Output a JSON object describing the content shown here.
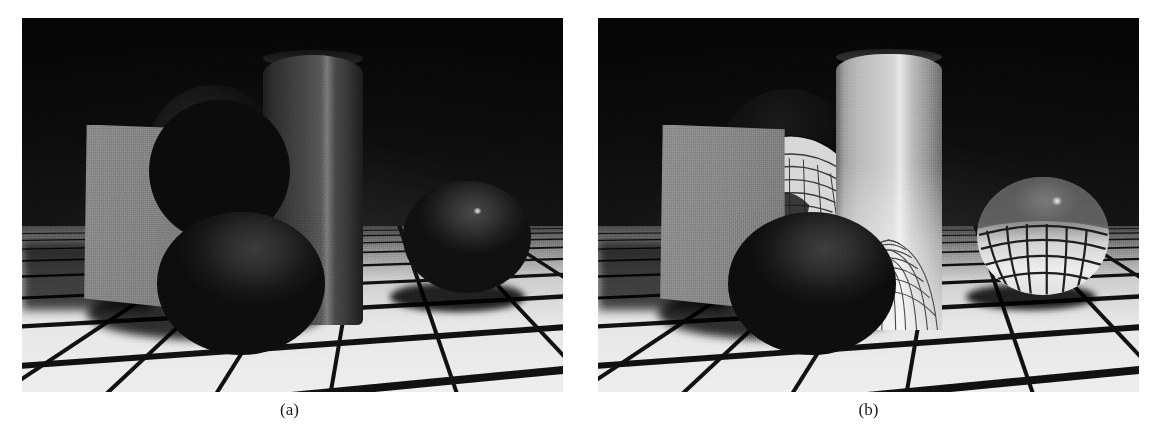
{
  "figure": {
    "kind": "two-panel raytraced scene comparison",
    "panels": [
      {
        "id": "a",
        "caption": "(a)",
        "description": "Scene rendered with opaque diffuse materials",
        "objects": [
          {
            "name": "back-wall",
            "material": "dark matte",
            "color": "#0a0a0a"
          },
          {
            "name": "checkered-floor",
            "material": "tiled, light",
            "color": "#e8e8e8",
            "grout_color": "#111111"
          },
          {
            "name": "upright-plane",
            "material": "grey diffuse",
            "color": "#848484"
          },
          {
            "name": "dark-disc",
            "material": "dark diffuse",
            "color": "#161616"
          },
          {
            "name": "tall-cylinder",
            "material": "dark specular",
            "color": "#3d3d3d"
          },
          {
            "name": "front-sphere",
            "material": "dark matte",
            "color": "#222222"
          },
          {
            "name": "right-sphere",
            "material": "dark matte with highlight",
            "color": "#2e2e2e"
          }
        ]
      },
      {
        "id": "b",
        "caption": "(b)",
        "description": "Same scene with transparent refractive glass materials",
        "objects": [
          {
            "name": "back-wall",
            "material": "dark matte",
            "color": "#0a0a0a"
          },
          {
            "name": "checkered-floor",
            "material": "tiled, light",
            "color": "#e8e8e8",
            "grout_color": "#111111"
          },
          {
            "name": "upright-plane",
            "material": "grey diffuse",
            "color": "#888888"
          },
          {
            "name": "glass-lens",
            "material": "refractive glass disc",
            "color": "#c8c8c8"
          },
          {
            "name": "glass-cylinder",
            "material": "refractive glass",
            "color": "#c9c9c9"
          },
          {
            "name": "front-sphere",
            "material": "dark matte",
            "color": "#242424"
          },
          {
            "name": "glass-sphere",
            "material": "refractive glass",
            "color": "#dcdcdc"
          }
        ]
      }
    ],
    "palette": {
      "page_background": "#ffffff",
      "caption_color": "#1a1a1a",
      "floor_light": "#efefef",
      "floor_grout": "#101010",
      "wall_dark": "#070707",
      "plane_grey": "#868686",
      "glass_bright": "#e9e9e9"
    }
  }
}
